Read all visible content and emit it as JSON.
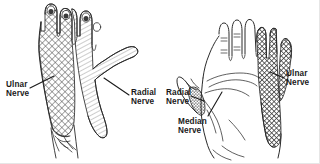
{
  "figure": {
    "background_color": "#ffffff",
    "ink_color": "#1a1a1a",
    "width": 320,
    "height": 164
  },
  "panels": [
    {
      "id": "dorsal-hand",
      "view_label": "dorsal (back of hand)",
      "side": "left",
      "regions": [
        {
          "name": "ulnar-nerve-territory",
          "pattern": "cross-hatch",
          "shade": "#555555",
          "covers": "little and ring fingers, ulnar border of dorsum"
        },
        {
          "name": "radial-nerve-territory",
          "pattern": "diagonal-hatch",
          "shade": "#9a9a9a",
          "covers": "thumb, index, middle fingers, radial dorsum"
        }
      ]
    },
    {
      "id": "palmar-hand",
      "view_label": "palmar (palm)",
      "side": "right",
      "regions": [
        {
          "name": "ulnar-nerve-territory",
          "pattern": "cross-hatch",
          "shade": "#4a4a4a",
          "covers": "little finger, half of ring finger, ulnar palm"
        },
        {
          "name": "radial-nerve-territory",
          "pattern": "dense-stipple",
          "shade": "#777777",
          "covers": "small patch at base of thumb"
        },
        {
          "name": "median-nerve-territory",
          "pattern": "unshaded",
          "shade": "#ffffff",
          "covers": "thumb, index, middle, half ring finger, central palm"
        }
      ]
    }
  ],
  "labels": [
    {
      "id": "ulnar-left",
      "text": "Ulnar\nNerve",
      "x": 6,
      "y": 80,
      "panel": "dorsal-hand"
    },
    {
      "id": "radial-left",
      "text": "Radial\nNerve",
      "x": 131,
      "y": 88,
      "panel": "dorsal-hand"
    },
    {
      "id": "radial-right",
      "text": "Radial\nNerve",
      "x": 166,
      "y": 88,
      "panel": "palmar-hand"
    },
    {
      "id": "median-right",
      "text": "Median\nNerve",
      "x": 178,
      "y": 117,
      "panel": "palmar-hand"
    },
    {
      "id": "ulnar-right",
      "text": "Ulnar\nNerve",
      "x": 286,
      "y": 69,
      "panel": "palmar-hand"
    }
  ]
}
